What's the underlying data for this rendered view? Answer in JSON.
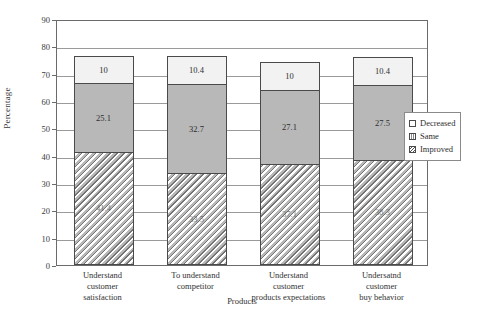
{
  "chart_data": {
    "type": "bar",
    "subtype": "stacked-bar",
    "title": "",
    "xlabel": "Products",
    "ylabel": "Percentage",
    "ylim": [
      0,
      90
    ],
    "ytick_step": 10,
    "yticks": [
      "90",
      "80",
      "70",
      "60",
      "50",
      "40",
      "30",
      "20",
      "10",
      "0"
    ],
    "grid": true,
    "grid_axis": "y",
    "legend_position": "right",
    "categories": [
      "Understand customer satisfaction",
      "To understand competitor",
      "Understand customer products expectations",
      "Undersatnd customer buy behavior"
    ],
    "category_lines": [
      [
        "Understand",
        "customer",
        "satisfaction"
      ],
      [
        "To understand",
        "competitor"
      ],
      [
        "Understand",
        "customer",
        "products expectations"
      ],
      [
        "Undersatnd",
        "customer",
        "buy behavior"
      ]
    ],
    "series": [
      {
        "name": "Improved",
        "values": [
          41.4,
          33.5,
          37.1,
          38.3
        ],
        "color": "#b8b8b8",
        "pattern": "diagonal-hatch"
      },
      {
        "name": "Same",
        "values": [
          25.1,
          32.7,
          27.1,
          27.5
        ],
        "color": "#b8b8b8",
        "pattern": "solid"
      },
      {
        "name": "Decreased",
        "values": [
          10.0,
          10.4,
          10.0,
          10.4
        ],
        "color": "#f2f2f2",
        "pattern": "solid"
      }
    ],
    "value_labels": {
      "Improved": [
        "41.4",
        "33.5",
        "37.1",
        "38.3"
      ],
      "Same": [
        "25.1",
        "32.7",
        "27.1",
        "27.5"
      ],
      "Decreased": [
        "10",
        "10.4",
        "10",
        "10.4"
      ]
    },
    "totals": [
      76.5,
      76.6,
      74.2,
      76.2
    ]
  },
  "legend": {
    "items": [
      {
        "label": "Decreased",
        "swatch": "decreased"
      },
      {
        "label": "Same",
        "swatch": "same"
      },
      {
        "label": "Improved",
        "swatch": "improved"
      }
    ]
  },
  "colors": {
    "frame": "#6b6b6b",
    "grid": "#9a9a9a",
    "bar_outline": "#4a4a4a",
    "decreased": "#f2f2f2",
    "same": "#b8b8b8",
    "improved": "#b8b8b8",
    "text": "#2e2e2e",
    "background": "#ffffff"
  }
}
